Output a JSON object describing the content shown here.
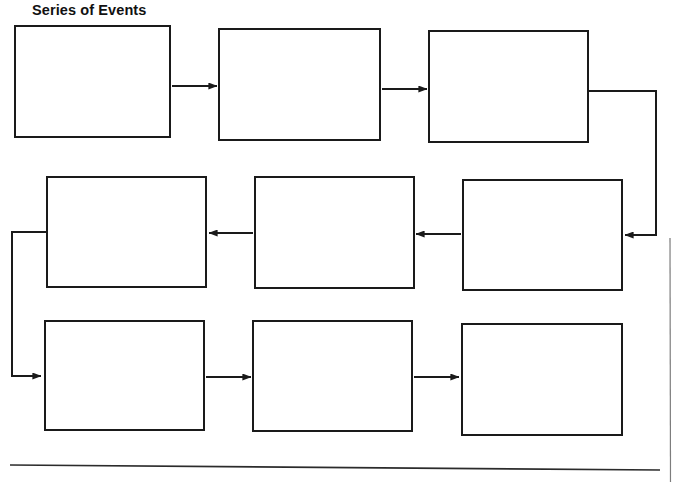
{
  "page": {
    "title": "Series of Events",
    "width": 678,
    "height": 482,
    "background_color": "#ffffff",
    "ink_color": "#1a1a1a"
  },
  "diagram": {
    "type": "flowchart-boustrophedon",
    "direction_note": "Row 1 left-to-right, row 2 right-to-left, row 3 left-to-right",
    "box_count": 9,
    "boxes": [
      {
        "id": "box-1",
        "row": 1,
        "order": 1,
        "text": "",
        "x": 14,
        "y": 25,
        "w": 157,
        "h": 113
      },
      {
        "id": "box-2",
        "row": 1,
        "order": 2,
        "text": "",
        "x": 218,
        "y": 28,
        "w": 163,
        "h": 113
      },
      {
        "id": "box-3",
        "row": 1,
        "order": 3,
        "text": "",
        "x": 428,
        "y": 30,
        "w": 161,
        "h": 113
      },
      {
        "id": "box-4",
        "row": 2,
        "order": 4,
        "text": "",
        "x": 462,
        "y": 179,
        "w": 161,
        "h": 112
      },
      {
        "id": "box-5",
        "row": 2,
        "order": 5,
        "text": "",
        "x": 254,
        "y": 176,
        "w": 161,
        "h": 113
      },
      {
        "id": "box-6",
        "row": 2,
        "order": 6,
        "text": "",
        "x": 46,
        "y": 176,
        "w": 161,
        "h": 112
      },
      {
        "id": "box-7",
        "row": 3,
        "order": 7,
        "text": "",
        "x": 44,
        "y": 320,
        "w": 161,
        "h": 111
      },
      {
        "id": "box-8",
        "row": 3,
        "order": 8,
        "text": "",
        "x": 252,
        "y": 320,
        "w": 161,
        "h": 112
      },
      {
        "id": "box-9",
        "row": 3,
        "order": 9,
        "text": "",
        "x": 461,
        "y": 323,
        "w": 162,
        "h": 113
      }
    ],
    "connectors": [
      {
        "id": "arrow-1-to-2",
        "kind": "straight-right",
        "from": "box-1",
        "to": "box-2"
      },
      {
        "id": "arrow-2-to-3",
        "kind": "straight-right",
        "from": "box-2",
        "to": "box-3"
      },
      {
        "id": "arrow-3-to-4",
        "kind": "elbow-right-wrap",
        "from": "box-3",
        "to": "box-4"
      },
      {
        "id": "arrow-4-to-5",
        "kind": "straight-left",
        "from": "box-4",
        "to": "box-5"
      },
      {
        "id": "arrow-5-to-6",
        "kind": "straight-left",
        "from": "box-5",
        "to": "box-6"
      },
      {
        "id": "arrow-6-to-7",
        "kind": "elbow-left-wrap",
        "from": "box-6",
        "to": "box-7"
      },
      {
        "id": "arrow-7-to-8",
        "kind": "straight-right",
        "from": "box-7",
        "to": "box-8"
      },
      {
        "id": "arrow-8-to-9",
        "kind": "straight-right",
        "from": "box-8",
        "to": "box-9"
      }
    ],
    "page_marks": [
      {
        "id": "right-margin-rule",
        "kind": "vertical-line"
      },
      {
        "id": "bottom-rule",
        "kind": "horizontal-line"
      }
    ]
  }
}
